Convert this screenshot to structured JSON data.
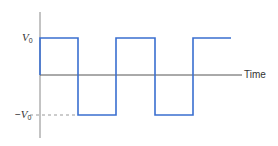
{
  "diagram": {
    "type": "square_wave",
    "x_axis_label": "Time",
    "y_levels": {
      "high": {
        "symbol": "V",
        "subscript": "0",
        "prefix": ""
      },
      "low": {
        "symbol": "V",
        "subscript": "0",
        "prefix": "−"
      }
    },
    "colors": {
      "wave": "#3a6fd0",
      "axis": "#555555",
      "dashed": "#999999"
    },
    "wave_points": [
      [
        40,
        75
      ],
      [
        40,
        38
      ],
      [
        78,
        38
      ],
      [
        78,
        115
      ],
      [
        116,
        115
      ],
      [
        116,
        38
      ],
      [
        155,
        38
      ],
      [
        155,
        115
      ],
      [
        193,
        115
      ],
      [
        193,
        38
      ],
      [
        231,
        38
      ]
    ]
  }
}
